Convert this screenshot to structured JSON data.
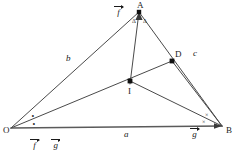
{
  "figure": {
    "width": 238,
    "height": 153,
    "stroke_color": "#4a4a4a",
    "text_color": "#1a1a1a",
    "background": "#ffffff"
  },
  "vertices": [
    {
      "id": "A",
      "label": "A",
      "x": 139,
      "y": 12
    },
    {
      "id": "O",
      "label": "O",
      "x": 11,
      "y": 128
    },
    {
      "id": "B",
      "label": "B",
      "x": 222,
      "y": 126
    },
    {
      "id": "D",
      "label": "D",
      "x": 172,
      "y": 61
    },
    {
      "id": "I",
      "label": "I",
      "x": 130,
      "y": 81
    }
  ],
  "vertex_labels": [
    {
      "name": "A",
      "text": "A",
      "x": 137,
      "y": 1
    },
    {
      "name": "O",
      "text": "O",
      "x": 3,
      "y": 128
    },
    {
      "name": "B",
      "text": "B",
      "x": 226,
      "y": 128
    },
    {
      "name": "D",
      "text": "D",
      "x": 175,
      "y": 50
    },
    {
      "name": "I",
      "text": "I",
      "x": 128,
      "y": 89
    }
  ],
  "side_labels": [
    {
      "name": "b",
      "text": "b",
      "x": 66,
      "y": 56
    },
    {
      "name": "a",
      "text": "a",
      "x": 124,
      "y": 131
    },
    {
      "name": "c",
      "text": "c",
      "x": 193,
      "y": 51
    }
  ],
  "angle_marks": [
    {
      "name": "angle-A-left",
      "symbol": "Δ",
      "x": 133,
      "y": 19
    },
    {
      "name": "angle-A-right",
      "symbol": "Δ",
      "x": 144,
      "y": 19
    },
    {
      "name": "angle-O-upper",
      "symbol": "∘",
      "x": 31,
      "y": 114
    },
    {
      "name": "angle-O-lower",
      "symbol": "∘",
      "x": 32,
      "y": 122
    },
    {
      "name": "angle-B-upper",
      "symbol": "×",
      "x": 205,
      "y": 114
    },
    {
      "name": "angle-B-lower",
      "symbol": "×",
      "x": 202,
      "y": 121
    }
  ],
  "vectors": [
    {
      "name": "vector-f",
      "glyph": "f",
      "x": 116,
      "y": 8
    },
    {
      "name": "vector-g",
      "glyph": "g",
      "x": 192,
      "y": 130
    }
  ],
  "caption": {
    "vectors": [
      {
        "name": "caption-vector-f",
        "glyph": "f"
      },
      {
        "name": "caption-vector-g",
        "glyph": "g"
      }
    ],
    "separator": ","
  },
  "segments": [
    {
      "name": "side-OA",
      "from": "O",
      "to": "A"
    },
    {
      "name": "side-AB",
      "from": "A",
      "to": "B"
    },
    {
      "name": "side-OB",
      "from": "O",
      "to": "B"
    },
    {
      "name": "bisector-A-to-I",
      "from": "A",
      "to": "I"
    },
    {
      "name": "bisector-O-to-D",
      "from": "O",
      "to": "D"
    },
    {
      "name": "segment-D-to-B",
      "from": "D",
      "to": "B"
    },
    {
      "name": "segment-I-to-B",
      "from": "I",
      "to": "B"
    }
  ]
}
